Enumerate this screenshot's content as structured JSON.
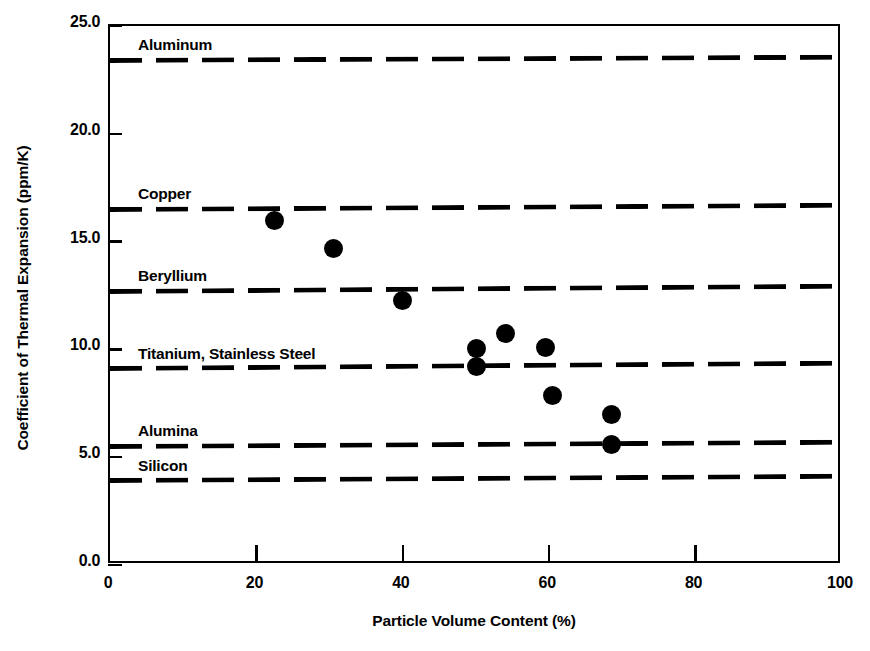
{
  "chart_data": {
    "type": "scatter",
    "title": "",
    "xlabel": "Particle Volume Content (%)",
    "ylabel": "Coefficient of Thermal Expansion (ppm/K)",
    "xlim": [
      0,
      100
    ],
    "ylim": [
      0.0,
      25.0
    ],
    "grid": false,
    "legend": "none",
    "xticks": [
      "0",
      "20",
      "40",
      "60",
      "80",
      "100"
    ],
    "xtick_values": [
      0,
      20,
      40,
      60,
      80,
      100
    ],
    "yticks": [
      "0.0",
      "5.0",
      "10.0",
      "15.0",
      "20.0",
      "25.0"
    ],
    "ytick_values": [
      0.0,
      5.0,
      10.0,
      15.0,
      20.0,
      25.0
    ],
    "series": [
      {
        "name": "Composite data",
        "marker": "filled-circle",
        "color": "#000000",
        "points": [
          {
            "x": 22.5,
            "y": 16.0
          },
          {
            "x": 30.5,
            "y": 14.7
          },
          {
            "x": 40.0,
            "y": 12.25
          },
          {
            "x": 50.0,
            "y": 10.05
          },
          {
            "x": 50.0,
            "y": 9.2
          },
          {
            "x": 54.0,
            "y": 10.75
          },
          {
            "x": 59.5,
            "y": 10.1
          },
          {
            "x": 60.5,
            "y": 7.85
          },
          {
            "x": 68.5,
            "y": 7.0
          },
          {
            "x": 68.5,
            "y": 5.6
          }
        ]
      }
    ],
    "reference_lines": [
      {
        "label": "Aluminum",
        "value": 23.4,
        "value_right": 23.55,
        "style": "dashed",
        "color": "#000000"
      },
      {
        "label": "Copper",
        "value": 16.5,
        "value_right": 16.7,
        "style": "dashed",
        "color": "#000000"
      },
      {
        "label": "Beryllium",
        "value": 12.7,
        "value_right": 12.95,
        "style": "dashed",
        "color": "#000000"
      },
      {
        "label": "Titanium, Stainless Steel",
        "value": 9.1,
        "value_right": 9.35,
        "style": "dashed",
        "color": "#000000"
      },
      {
        "label": "Alumina",
        "value": 5.5,
        "value_right": 5.7,
        "style": "dashed",
        "color": "#000000"
      },
      {
        "label": "Silicon",
        "value": 3.9,
        "value_right": 4.1,
        "style": "dashed",
        "color": "#000000"
      }
    ]
  },
  "colors": {
    "axis": "#000000",
    "marker": "#000000",
    "background": "#ffffff"
  }
}
